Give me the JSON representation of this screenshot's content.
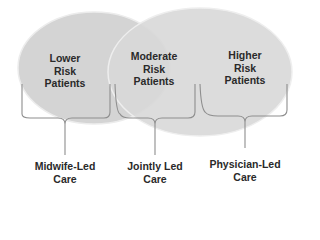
{
  "diagram": {
    "type": "overlapping-ellipses-with-braces",
    "circles": [
      {
        "id": "left",
        "label": "Lower Risk Patients",
        "lines": [
          "Lower",
          "Risk",
          "Patients"
        ]
      },
      {
        "id": "right",
        "label": "Higher Risk Patients",
        "lines": [
          "Higher",
          "Risk",
          "Patients"
        ]
      }
    ],
    "overlap": {
      "label": "Moderate Risk Patients",
      "lines": [
        "Moderate",
        "Risk",
        "Patients"
      ]
    },
    "braces": [
      {
        "id": "midwife",
        "lines": [
          "Midwife-Led",
          "Care"
        ]
      },
      {
        "id": "joint",
        "lines": [
          "Jointly Led",
          "Care"
        ]
      },
      {
        "id": "physician",
        "lines": [
          "Physician-Led",
          "Care"
        ]
      }
    ],
    "colors": {
      "fill": "#d6d6d6",
      "stroke": "#9a9a9a",
      "edge": "#eeeeee",
      "text": "#2a2a2a"
    }
  }
}
